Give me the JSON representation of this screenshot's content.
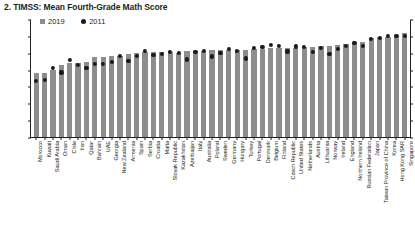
{
  "chart_data": {
    "type": "bar",
    "title": "2. TIMSS: Mean Fourth-Grade Math Score",
    "xlabel": "",
    "ylabel": "",
    "ylim": [
      0,
      700
    ],
    "yticks": [
      0,
      100,
      200,
      300,
      400,
      500,
      600,
      700
    ],
    "grid": false,
    "legend_position": "top-left",
    "legend": [
      {
        "name": "2019",
        "marker": "square",
        "color": "#8d8d8d"
      },
      {
        "name": "2011",
        "marker": "circle",
        "color": "#1a1a1a"
      }
    ],
    "categories": [
      "Morocco",
      "Kuwait",
      "Saudi Arabia",
      "Oman",
      "Chile",
      "Iran",
      "Qatar",
      "Bahrain",
      "UAE",
      "Georgia",
      "New Zealand",
      "Armenia",
      "Spain",
      "Serbia",
      "Croatia",
      "Malta",
      "Slovak Republic",
      "Kazakhstan",
      "Azerbaijan",
      "Italy",
      "Australia",
      "Poland",
      "Sweden",
      "Germany",
      "Hungary",
      "Turkey",
      "Portugal",
      "Denmark",
      "Belgium",
      "Finland",
      "Czech Republic",
      "United States",
      "Netherlands",
      "Austria",
      "Lithuania",
      "Norway",
      "Ireland",
      "England",
      "Northern Ireland",
      "Russian Federation",
      "Japan",
      "Taiwan Province of China",
      "Korea",
      "Hong Kong SAR",
      "Singapore"
    ],
    "series": [
      {
        "name": "2019",
        "marker": "bar",
        "values": [
          383,
          383,
          398,
          431,
          441,
          443,
          449,
          481,
          481,
          483,
          487,
          498,
          502,
          508,
          509,
          510,
          510,
          503,
          515,
          515,
          516,
          520,
          521,
          521,
          523,
          523,
          525,
          525,
          532,
          532,
          533,
          535,
          538,
          539,
          542,
          543,
          548,
          556,
          566,
          567,
          593,
          599,
          600,
          602,
          625
        ]
      },
      {
        "name": "2011",
        "marker": "dot",
        "values": [
          335,
          342,
          410,
          385,
          462,
          431,
          413,
          436,
          434,
          450,
          486,
          452,
          482,
          516,
          490,
          496,
          507,
          501,
          463,
          508,
          516,
          481,
          504,
          528,
          515,
          469,
          532,
          537,
          549,
          545,
          511,
          541,
          540,
          508,
          534,
          495,
          527,
          542,
          562,
          542,
          585,
          591,
          605,
          602,
          606
        ]
      }
    ]
  }
}
